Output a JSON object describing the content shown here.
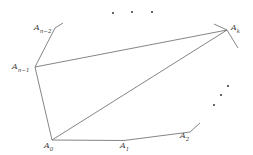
{
  "diagram": {
    "type": "polygon-triangulation",
    "stroke_color": "#777777",
    "vertices": [
      {
        "id": "A0",
        "label": "A",
        "sub": "0",
        "x": 52,
        "y": 140
      },
      {
        "id": "A1",
        "label": "A",
        "sub": "1",
        "x": 124,
        "y": 141
      },
      {
        "id": "A2",
        "label": "A",
        "sub": "2",
        "x": 190,
        "y": 132
      },
      {
        "id": "Ak",
        "label": "A",
        "sub": "k",
        "x": 227,
        "y": 30
      },
      {
        "id": "An-1",
        "label": "A",
        "sub": "n−1",
        "x": 35,
        "y": 67
      },
      {
        "id": "An-2",
        "label": "A",
        "sub": "n−2",
        "x": 55,
        "y": 28
      }
    ],
    "edges": [
      [
        "A0",
        "A1"
      ],
      [
        "A1",
        "A2"
      ],
      [
        "A0",
        "An-1"
      ],
      [
        "An-1",
        "An-2"
      ],
      [
        "An-1",
        "Ak"
      ],
      [
        "A0",
        "Ak"
      ]
    ],
    "ellipsis_dots_top": [
      [
        113,
        13
      ],
      [
        132,
        12
      ],
      [
        152,
        12
      ]
    ],
    "ellipsis_dots_right": [
      [
        214,
        105
      ],
      [
        221,
        95
      ],
      [
        228,
        86
      ]
    ]
  }
}
